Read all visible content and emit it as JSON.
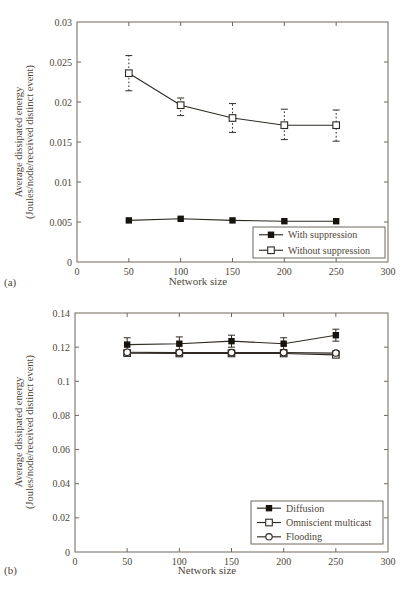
{
  "figure": {
    "background": "#ffffff",
    "ink": "#2f2a24",
    "marker_fill": "#17130f",
    "frame_color": "#6f685f",
    "text_color": "#4e4638"
  },
  "chart_data": [
    {
      "type": "line",
      "panel_label": "(a)",
      "xlabel": "Network size",
      "ylabel": "Average dissipated energy",
      "ylabel2": "(Joules/node/received distinct event)",
      "xlim": [
        0,
        300
      ],
      "ylim": [
        0,
        0.03
      ],
      "xticks": [
        0,
        50,
        100,
        150,
        200,
        250,
        300
      ],
      "yticks": [
        0,
        0.005,
        0.01,
        0.015,
        0.02,
        0.025,
        0.03
      ],
      "grid": false,
      "legend_position": "lower right",
      "x": [
        50,
        100,
        150,
        200,
        250
      ],
      "series": [
        {
          "name": "With suppression",
          "marker": "filled-square",
          "line": "solid",
          "values": [
            0.0052,
            0.0054,
            0.0052,
            0.0051,
            0.0051
          ]
        },
        {
          "name": "Without suppression",
          "marker": "open-square",
          "line": "solid",
          "error_style": "dotted",
          "values": [
            0.0236,
            0.0196,
            0.018,
            0.0171,
            0.0171
          ],
          "err_low": [
            0.0214,
            0.0183,
            0.0162,
            0.0153,
            0.0151
          ],
          "err_high": [
            0.0258,
            0.0205,
            0.0198,
            0.0191,
            0.019
          ]
        }
      ]
    },
    {
      "type": "line",
      "panel_label": "(b)",
      "xlabel": "Network size",
      "ylabel": "Average dissipated energy",
      "ylabel2": "(Joules/node/received distinct event)",
      "xlim": [
        0,
        300
      ],
      "ylim": [
        0,
        0.14
      ],
      "xticks": [
        0,
        50,
        100,
        150,
        200,
        250,
        300
      ],
      "yticks": [
        0,
        0.02,
        0.04,
        0.06,
        0.08,
        0.1,
        0.12,
        0.14
      ],
      "grid": false,
      "legend_position": "lower right",
      "x": [
        50,
        100,
        150,
        200,
        250
      ],
      "series": [
        {
          "name": "Diffusion",
          "marker": "filled-square",
          "line": "solid",
          "error_style": "solid",
          "values": [
            0.1215,
            0.122,
            0.1235,
            0.122,
            0.127
          ],
          "err_low": [
            0.118,
            0.1185,
            0.12,
            0.1185,
            0.1235
          ],
          "err_high": [
            0.1255,
            0.126,
            0.127,
            0.1255,
            0.1305
          ]
        },
        {
          "name": "Omniscient multicast",
          "marker": "open-square",
          "line": "solid",
          "error_style": "solid",
          "values": [
            0.1165,
            0.1163,
            0.1163,
            0.1163,
            0.1155
          ],
          "err_low": [
            0.115,
            0.1148,
            0.1148,
            0.1148,
            0.114
          ],
          "err_high": [
            0.118,
            0.1178,
            0.1178,
            0.1178,
            0.117
          ]
        },
        {
          "name": "Flooding",
          "marker": "open-circle",
          "line": "solid",
          "error_style": "solid",
          "values": [
            0.117,
            0.1168,
            0.1168,
            0.1168,
            0.1165
          ],
          "err_low": [
            0.1155,
            0.1153,
            0.1153,
            0.1153,
            0.115
          ],
          "err_high": [
            0.1185,
            0.1183,
            0.1183,
            0.1183,
            0.118
          ]
        }
      ]
    }
  ]
}
